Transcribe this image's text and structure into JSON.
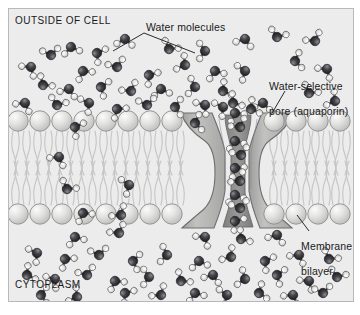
{
  "figure": {
    "background_color": "#ececed",
    "border_color": "#b9b9bb"
  },
  "labels": {
    "outside": "OUTSIDE OF CELL",
    "cytoplasm": "CYTOPLASM",
    "water_molecules": "Water molecules",
    "pore_line1": "Water-selective",
    "pore_line2": "pore (aquaporin)",
    "bilayer_line1": "Membrane",
    "bilayer_line2": "bilayer"
  },
  "colors": {
    "oxygen": "#2f2f33",
    "oxygen_highlight": "#6d6d72",
    "hydrogen": "#dededc",
    "hydrogen_edge": "#5a5a5e",
    "bond": "#4a4a4e",
    "head_fill": "#d9d9d8",
    "head_edge": "#8d8d8f",
    "tail": "#c9c9c7",
    "protein_fill": "#b5b5b4",
    "protein_edge": "#6e6e70",
    "pore_fill": "#8e8e8d",
    "leader": "#2b2b2e",
    "text": "#1a1a1a"
  },
  "structures": {
    "membrane": {
      "upper_head_row_y": 120,
      "lower_head_row_y": 205,
      "head_diameter": 21,
      "head_spacing": 22,
      "tail_band_top": 131,
      "tail_band_bottom": 195,
      "description": "Phospholipid bilayer: two rows of spherical head groups with wavy hydrocarbon tails between them"
    },
    "aquaporin": {
      "shape": "hourglass",
      "center_x": 228,
      "top_y": 112,
      "bottom_y": 214,
      "channel_width_narrow": 9,
      "channel_width_wide": 26,
      "water_count_in_pore": 11,
      "description": "Hourglass-shaped transmembrane protein with a narrow central channel conducting water in single file"
    }
  },
  "water_molecules": {
    "note": "Each molecule: one dark oxygen sphere bonded to two pale hydrogen spheres",
    "oxygen_radius": 4.6,
    "hydrogen_radius": 3.3,
    "outside_count": 41,
    "cytoplasm_count": 38,
    "in_membrane_count": 7
  },
  "leader_lines": {
    "water_molecules_left": "from label left edge down-left to a molecule above the membrane",
    "water_molecules_right": "from label down-right to a molecule near the pore entrance",
    "pore": "from label down-left to the protein shoulder",
    "bilayer": "from label up-left to a head-group sphere"
  }
}
